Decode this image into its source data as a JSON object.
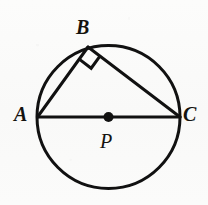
{
  "figure": {
    "background_color": "#fbfbfa",
    "stroke_color": "#111111",
    "labels": {
      "A": "A",
      "B": "B",
      "C": "C",
      "P": "P"
    }
  },
  "chart_data": {
    "type": "diagram",
    "shapes": [
      {
        "kind": "circle",
        "name": "circle-P",
        "center": [
          108.5,
          117
        ],
        "radius": 71.5,
        "stroke": "#111111",
        "stroke_width": 3,
        "fill": "none"
      },
      {
        "kind": "point",
        "name": "center-point-P",
        "position": [
          108.5,
          117
        ],
        "radius": 5,
        "fill": "#111111",
        "label": "P"
      },
      {
        "kind": "segment",
        "name": "diameter-AC",
        "from": [
          37.5,
          117
        ],
        "to": [
          180,
          117
        ],
        "stroke_width": 3
      },
      {
        "kind": "segment",
        "name": "chord-AB",
        "from": [
          37.5,
          117
        ],
        "to": [
          88,
          47
        ],
        "stroke_width": 3
      },
      {
        "kind": "segment",
        "name": "chord-BC",
        "from": [
          88,
          47
        ],
        "to": [
          180,
          117
        ],
        "stroke_width": 3
      },
      {
        "kind": "right-angle-mark",
        "name": "right-angle-at-B",
        "vertex": [
          88,
          47
        ],
        "size": 15,
        "stroke_width": 3
      }
    ],
    "vertices": [
      {
        "label": "A",
        "position": [
          37.5,
          117
        ],
        "label_position": [
          14,
          104
        ]
      },
      {
        "label": "B",
        "position": [
          88,
          47
        ],
        "label_position": [
          76,
          17
        ]
      },
      {
        "label": "C",
        "position": [
          180,
          117
        ],
        "label_position": [
          183,
          104
        ]
      },
      {
        "label": "P",
        "position": [
          108.5,
          117
        ],
        "label_position": [
          100,
          131
        ]
      }
    ],
    "annotations": [
      "AC is a diameter of circle P",
      "Angle ABC is a right angle (90 degrees)"
    ]
  }
}
